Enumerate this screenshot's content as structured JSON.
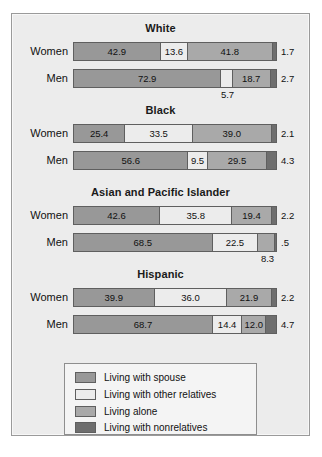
{
  "chart_data": {
    "type": "bar",
    "title": "",
    "subtype": "stacked-horizontal-100-percent",
    "xlabel": "",
    "ylabel": "",
    "xlim": [
      0,
      100
    ],
    "grid": false,
    "legend_position": "bottom-center",
    "series": [
      {
        "name": "Living with spouse",
        "color": "#989898"
      },
      {
        "name": "Living with other relatives",
        "color": "#ececec"
      },
      {
        "name": "Living alone",
        "color": "#a9a9a9"
      },
      {
        "name": "Living with nonrelatives",
        "color": "#6e6e6e"
      }
    ],
    "groups": [
      {
        "label": "White",
        "rows": [
          {
            "label": "Women",
            "values": [
              42.9,
              13.6,
              41.8,
              1.7
            ],
            "labels": [
              "42.9",
              "13.6",
              "41.8",
              "1.7"
            ],
            "label_placement": [
              "inside",
              "inside",
              "inside",
              "right"
            ]
          },
          {
            "label": "Men",
            "values": [
              72.9,
              5.7,
              18.7,
              2.7
            ],
            "labels": [
              "72.9",
              "5.7",
              "18.7",
              "2.7"
            ],
            "label_placement": [
              "inside",
              "below",
              "inside",
              "right"
            ]
          }
        ]
      },
      {
        "label": "Black",
        "rows": [
          {
            "label": "Women",
            "values": [
              25.4,
              33.5,
              39.0,
              2.1
            ],
            "labels": [
              "25.4",
              "33.5",
              "39.0",
              "2.1"
            ],
            "label_placement": [
              "inside",
              "inside",
              "inside",
              "right"
            ]
          },
          {
            "label": "Men",
            "values": [
              56.6,
              9.5,
              29.5,
              4.3
            ],
            "labels": [
              "56.6",
              "9.5",
              "29.5",
              "4.3"
            ],
            "label_placement": [
              "inside",
              "inside",
              "inside",
              "right"
            ]
          }
        ]
      },
      {
        "label": "Asian and Pacific Islander",
        "rows": [
          {
            "label": "Women",
            "values": [
              42.6,
              35.8,
              19.4,
              2.2
            ],
            "labels": [
              "42.6",
              "35.8",
              "19.4",
              "2.2"
            ],
            "label_placement": [
              "inside",
              "inside",
              "inside",
              "right"
            ]
          },
          {
            "label": "Men",
            "values": [
              68.5,
              22.5,
              8.3,
              0.5
            ],
            "labels": [
              "68.5",
              "22.5",
              "8.3",
              ".5"
            ],
            "label_placement": [
              "inside",
              "inside",
              "below",
              "right"
            ]
          }
        ]
      },
      {
        "label": "Hispanic",
        "rows": [
          {
            "label": "Women",
            "values": [
              39.9,
              36.0,
              21.9,
              2.2
            ],
            "labels": [
              "39.9",
              "36.0",
              "21.9",
              "2.2"
            ],
            "label_placement": [
              "inside",
              "inside",
              "inside",
              "right"
            ]
          },
          {
            "label": "Men",
            "values": [
              68.7,
              14.4,
              12.0,
              4.7
            ],
            "labels": [
              "68.7",
              "14.4",
              "12.0",
              "4.7"
            ],
            "label_placement": [
              "inside",
              "inside",
              "inside",
              "right"
            ]
          }
        ]
      }
    ],
    "legend": [
      {
        "label": "Living with spouse",
        "color": "#989898"
      },
      {
        "label": "Living with other relatives",
        "color": "#ececec"
      },
      {
        "label": "Living alone",
        "color": "#a9a9a9"
      },
      {
        "label": "Living with nonrelatives",
        "color": "#6e6e6e"
      }
    ]
  },
  "caption_fragment": ""
}
